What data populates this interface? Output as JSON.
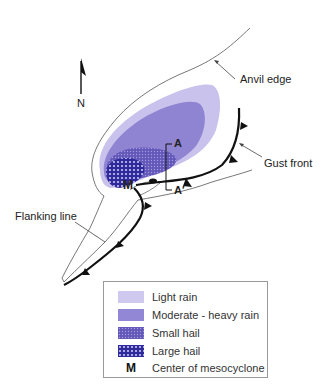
{
  "diagram": {
    "north_label": "N",
    "labels": {
      "anvil_edge": "Anvil edge",
      "gust_front": "Gust front",
      "flanking_line": "Flanking line",
      "section_start": "A",
      "section_end": "A′",
      "mesocyclone": "M"
    },
    "colors": {
      "light_rain": "#c9c2ec",
      "moderate_heavy_rain": "#8f84d2",
      "small_hail": "#5e52b4",
      "large_hail": "#2f2a9c",
      "front_line": "#111111",
      "outline": "#444444"
    }
  },
  "legend": {
    "items": [
      {
        "label": "Light rain",
        "swatch": "light-rain"
      },
      {
        "label": "Moderate - heavy rain",
        "swatch": "moderate-heavy-rain"
      },
      {
        "label": "Small hail",
        "swatch": "small-hail"
      },
      {
        "label": "Large hail",
        "swatch": "large-hail"
      },
      {
        "label": "Center of mesocyclone",
        "symbol": "M"
      }
    ]
  }
}
